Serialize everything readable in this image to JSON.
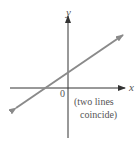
{
  "diagram": {
    "axes": {
      "x_label": "x",
      "y_label": "y",
      "origin_label": "0"
    },
    "annotation": {
      "line1": "(two lines",
      "line2": "coincide)"
    },
    "line": {
      "description": "single line with positive slope (two coincident lines)",
      "color": "#8a8a8a",
      "x_intercept_sign": "negative",
      "y_intercept_sign": "positive"
    },
    "colors": {
      "axis": "#333333",
      "line": "#8a8a8a",
      "text": "#555555"
    }
  }
}
